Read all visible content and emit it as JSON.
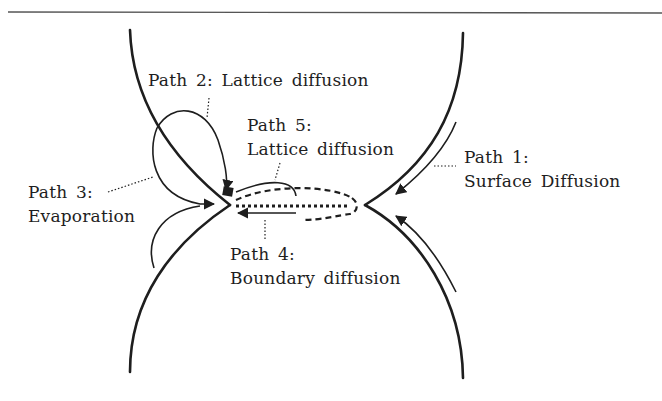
{
  "diagram": {
    "title": "",
    "colors": {
      "ink": "#1e1e1e",
      "background": "#ffffff"
    },
    "labels": {
      "path1": {
        "line1": "Path 1:",
        "line2": "Surface Diffusion"
      },
      "path2": {
        "line1": "Path 2: Lattice diffusion"
      },
      "path3": {
        "line1": "Path 3:",
        "line2": "Evaporation"
      },
      "path4": {
        "line1": "Path 4:",
        "line2": "Boundary diffusion"
      },
      "path5": {
        "line1": "Path 5:",
        "line2": "Lattice diffusion"
      }
    },
    "nodes": [
      {
        "id": "upper-particle",
        "label": ""
      },
      {
        "id": "lower-particle",
        "label": ""
      },
      {
        "id": "grain-boundary",
        "label": ""
      },
      {
        "id": "neck-left",
        "label": ""
      },
      {
        "id": "neck-right",
        "label": ""
      }
    ],
    "edges": [
      {
        "from": "upper-particle-surface",
        "to": "neck-right",
        "label": "Path 1: Surface Diffusion"
      },
      {
        "from": "lower-particle-surface",
        "to": "neck-right",
        "label": "Path 1: Surface Diffusion"
      },
      {
        "from": "upper-particle-surface",
        "to": "neck-left",
        "label": "Path 2: Lattice diffusion"
      },
      {
        "from": "particle-surface",
        "to": "neck-left",
        "label": "Path 3: Evaporation"
      },
      {
        "from": "grain-boundary",
        "to": "neck-left",
        "label": "Path 4: Boundary diffusion"
      },
      {
        "from": "grain-boundary",
        "to": "neck-left",
        "label": "Path 5: Lattice diffusion"
      }
    ]
  }
}
